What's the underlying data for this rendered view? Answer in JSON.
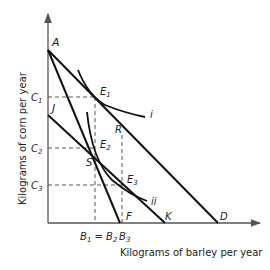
{
  "diagram": {
    "type": "economics-budget-line-indifference-curve",
    "x_axis_label": "Kilograms of barley per year",
    "y_axis_label": "Kilograms of corn per year",
    "y_ticks": {
      "c1": {
        "main": "C",
        "sub": "1"
      },
      "c2": {
        "main": "C",
        "sub": "2"
      },
      "c3": {
        "main": "C",
        "sub": "3"
      }
    },
    "x_ticks": {
      "b1b2": {
        "main1": "B",
        "sub1": "1",
        "eq": " = ",
        "main2": "B",
        "sub2": "2"
      },
      "b3": {
        "main": "B",
        "sub": "3"
      }
    },
    "points": {
      "A": "A",
      "J": "J",
      "D": "D",
      "F": "F",
      "K": "K",
      "R": "R",
      "S": "S",
      "E1": {
        "main": "E",
        "sub": "1"
      },
      "E2": {
        "main": "E",
        "sub": "2"
      },
      "E3": {
        "main": "E",
        "sub": "3"
      }
    },
    "curves": {
      "i": "i",
      "ii": "ii"
    },
    "lines": [
      {
        "name": "budget-line-AD",
        "from": "A",
        "to": "D"
      },
      {
        "name": "budget-line-AF",
        "from": "A",
        "to": "F"
      },
      {
        "name": "budget-line-JK",
        "from": "J",
        "to": "K"
      }
    ],
    "colors": {
      "line": "#111111",
      "axis": "#555555",
      "dashed": "#444444",
      "text": "#222222"
    }
  }
}
